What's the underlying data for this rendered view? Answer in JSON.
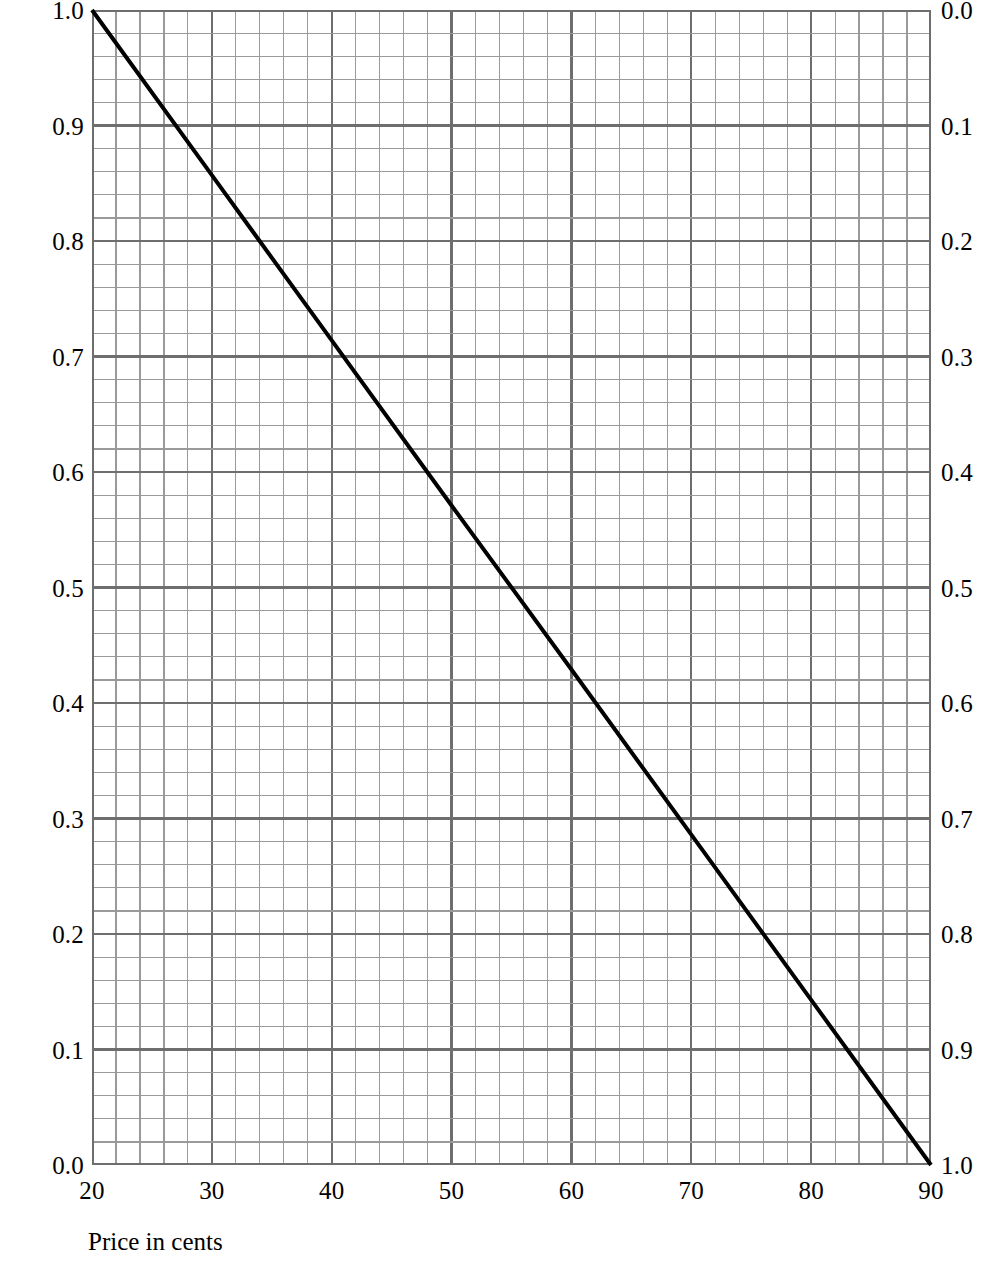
{
  "chart_data": {
    "type": "line",
    "title": "",
    "subtitle": "",
    "xlabel": "Price in cents",
    "ylabel": "Pounds of coffee",
    "ylabel_right": "",
    "xlim": [
      20,
      90
    ],
    "ylim": [
      0.0,
      1.0
    ],
    "ylim_right": [
      1.0,
      0.0
    ],
    "grid": true,
    "grid_minor": true,
    "legend": "none",
    "x_ticks": [
      20,
      30,
      40,
      50,
      60,
      70,
      80,
      90
    ],
    "x_tick_labels": [
      "20",
      "30",
      "40",
      "50",
      "60",
      "70",
      "80",
      "90"
    ],
    "x_minor_step": 2,
    "y_ticks_left": [
      0.0,
      0.1,
      0.2,
      0.3,
      0.4,
      0.5,
      0.6,
      0.7,
      0.8,
      0.9,
      1.0
    ],
    "y_tick_labels_left": [
      "0.0",
      "0.1",
      "0.2",
      "0.3",
      "0.4",
      "0.5",
      "0.6",
      "0.7",
      "0.8",
      "0.9",
      "1.0"
    ],
    "y_ticks_right": [
      0.0,
      0.1,
      0.2,
      0.3,
      0.4,
      0.5,
      0.6,
      0.7,
      0.8,
      0.9,
      1.0
    ],
    "y_tick_labels_right": [
      "0.0",
      "0.1",
      "0.2",
      "0.3",
      "0.4",
      "0.5",
      "0.6",
      "0.7",
      "0.8",
      "0.9",
      "1.0"
    ],
    "y_minor_step": 0.02,
    "series": [
      {
        "name": "Demand for coffee",
        "color": "#000000",
        "line_width": 4,
        "x": [
          20,
          30,
          40,
          50,
          60,
          70,
          80,
          90
        ],
        "values": [
          1.0,
          0.857,
          0.714,
          0.571,
          0.429,
          0.286,
          0.143,
          0.0
        ]
      }
    ],
    "colors": {
      "line": "#000000",
      "grid_major": "#6e6e6e",
      "grid_minor": "#9a9a9a",
      "background": "#ffffff",
      "text": "#000000"
    },
    "annotations": []
  },
  "axes": {
    "x_title": "Price in cents",
    "y_title_left": "Pounds of coffee"
  }
}
